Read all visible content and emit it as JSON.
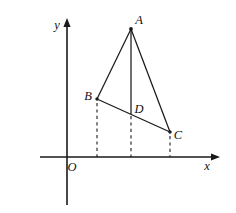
{
  "figure": {
    "kind": "plane-geometry-diagram",
    "background_color": "#ffffff",
    "ink_color": "#1a1a1a",
    "width": 236,
    "height": 213
  },
  "axes": {
    "x_axis": {
      "label": "x",
      "label_x": 207,
      "label_y": 166,
      "y_position": 157,
      "x_start": 40,
      "x_end": 220,
      "has_arrow": true
    },
    "y_axis": {
      "label": "y",
      "label_x": 57,
      "label_y": 25,
      "x_position": 67,
      "y_start": 18,
      "y_end": 205,
      "has_arrow": true
    },
    "origin": {
      "label": "O",
      "label_x": 72,
      "label_y": 167,
      "x": 67,
      "y": 157
    }
  },
  "points": [
    {
      "name": "A",
      "x": 131,
      "y": 29,
      "label_x": 139,
      "label_y": 20,
      "dot": true
    },
    {
      "name": "B",
      "x": 97,
      "y": 99,
      "label_x": 88,
      "label_y": 96,
      "dot": true
    },
    {
      "name": "D",
      "x": 131,
      "y": 112,
      "label_x": 139,
      "label_y": 109,
      "dot": false
    },
    {
      "name": "C",
      "x": 170,
      "y": 132,
      "label_x": 178,
      "label_y": 135,
      "dot": true
    }
  ],
  "segments": [
    {
      "name": "AB",
      "from": "A",
      "to": "B",
      "x1": 131,
      "y1": 29,
      "x2": 97,
      "y2": 99,
      "style": "solid"
    },
    {
      "name": "AC",
      "from": "A",
      "to": "C",
      "x1": 131,
      "y1": 29,
      "x2": 170,
      "y2": 132,
      "style": "solid"
    },
    {
      "name": "AD",
      "from": "A",
      "to": "D",
      "x1": 131,
      "y1": 29,
      "x2": 131,
      "y2": 114,
      "style": "solid"
    },
    {
      "name": "BC",
      "from": "B",
      "to": "C",
      "x1": 97,
      "y1": 99,
      "x2": 170,
      "y2": 132,
      "style": "solid"
    }
  ],
  "drop_lines": [
    {
      "name": "B-foot",
      "x1": 97,
      "y1": 103,
      "x2": 97,
      "y2": 157,
      "style": "dashed"
    },
    {
      "name": "D-foot",
      "x1": 131,
      "y1": 116,
      "x2": 131,
      "y2": 157,
      "style": "dashed"
    },
    {
      "name": "C-foot",
      "x1": 170,
      "y1": 136,
      "x2": 170,
      "y2": 157,
      "style": "dashed"
    }
  ]
}
